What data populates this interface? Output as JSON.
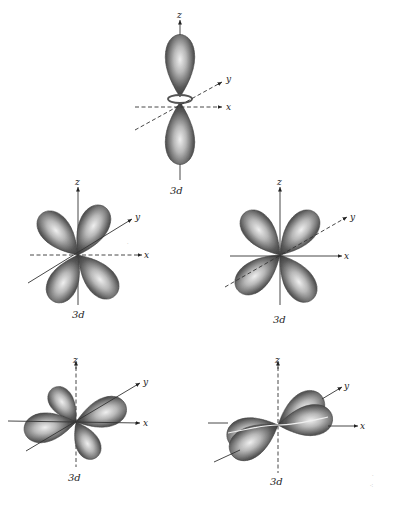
{
  "figure": {
    "panels": [
      {
        "id": "dz2",
        "caption": "3d",
        "axes": {
          "z": "z",
          "y": "y",
          "x": "x"
        },
        "position": "top-center"
      },
      {
        "id": "dxz",
        "caption": "3d",
        "axes": {
          "z": "z",
          "y": "y",
          "x": "x"
        },
        "position": "middle-left"
      },
      {
        "id": "dyz",
        "caption": "3d",
        "axes": {
          "z": "z",
          "y": "y",
          "x": "x"
        },
        "position": "middle-right"
      },
      {
        "id": "dxy",
        "caption": "3d",
        "axes": {
          "z": "z",
          "y": "y",
          "x": "x"
        },
        "position": "bottom-left"
      },
      {
        "id": "dx2y2",
        "caption": "3d",
        "axes": {
          "z": "z",
          "y": "y",
          "x": "x"
        },
        "position": "bottom-right"
      }
    ],
    "colors": {
      "lobe_dark": "#3c3c3c",
      "lobe_light": "#e8e8e8",
      "axis": "#333333",
      "background": "#ffffff"
    }
  }
}
